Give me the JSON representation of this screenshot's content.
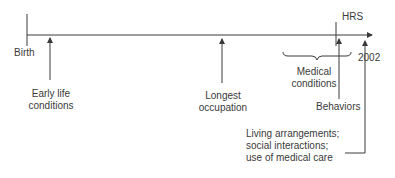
{
  "diagram": {
    "type": "timeline",
    "line_color": "#3a3a3a",
    "text_color": "#3a3a3a",
    "start_label": "Birth",
    "survey_label": "HRS",
    "end_label": "2002",
    "events": [
      {
        "id": "early-life",
        "line1": "Early life",
        "line2": "conditions"
      },
      {
        "id": "longest-occupation",
        "line1": "Longest",
        "line2": "occupation"
      },
      {
        "id": "medical-conditions",
        "line1": "Medical",
        "line2": "conditions"
      },
      {
        "id": "behaviors",
        "line1": "Behaviors"
      },
      {
        "id": "living-arrangements",
        "line1": "Living arrangements;",
        "line2": "social interactions;",
        "line3": "use of medical care"
      }
    ]
  }
}
